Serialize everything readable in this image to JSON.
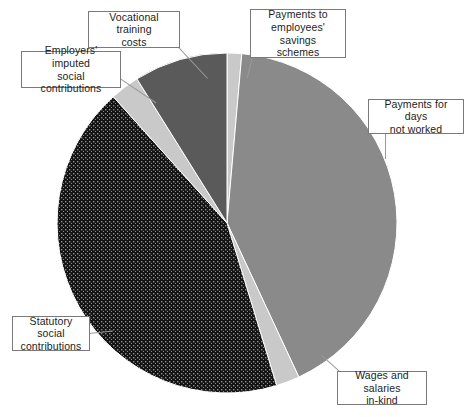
{
  "chart_data": {
    "type": "pie",
    "title": "",
    "subtitle": "",
    "xlabel": "",
    "ylabel": "",
    "legend_position": "callout-labels",
    "grid": false,
    "categories": [
      "Payments to employees' savings schemes",
      "Payments for days not worked",
      "Wages and salaries in-kind",
      "Statutory social contributions",
      "Employers' imputed social contributions",
      "Vocational training costs"
    ],
    "values": [
      1.4,
      41.7,
      2.2,
      43.1,
      2.8,
      8.8
    ],
    "slices": [
      {
        "label": "Payments to employees' savings schemes",
        "value": 1.4,
        "start_angle_deg": 0,
        "end_angle_deg": 5,
        "color": "#c9c9c9",
        "fill": "solid"
      },
      {
        "label": "Payments for days not worked",
        "value": 41.7,
        "start_angle_deg": 5,
        "end_angle_deg": 155,
        "color": "#8a8a8a",
        "fill": "solid"
      },
      {
        "label": "Wages and salaries in-kind",
        "value": 2.2,
        "start_angle_deg": 155,
        "end_angle_deg": 163,
        "color": "#c9c9c9",
        "fill": "solid"
      },
      {
        "label": "Statutory social contributions",
        "value": 43.1,
        "start_angle_deg": 163,
        "end_angle_deg": 318,
        "color": "#171717",
        "fill": "dotted"
      },
      {
        "label": "Employers' imputed social contributions",
        "value": 2.8,
        "start_angle_deg": 318,
        "end_angle_deg": 328,
        "color": "#c9c9c9",
        "fill": "solid"
      },
      {
        "label": "Vocational training costs",
        "value": 8.8,
        "start_angle_deg": 328,
        "end_angle_deg": 360,
        "color": "#5a5a5a",
        "fill": "solid"
      }
    ],
    "geometry": {
      "center_x": 227,
      "center_y": 223,
      "radius": 170
    }
  },
  "labels": {
    "vocational_training": "Vocational training\ncosts",
    "employers_imputed": "Employers' imputed\nsocial contributions",
    "savings_schemes": "Payments to\nemployees' savings\nschemes",
    "days_not_worked": "Payments for days\nnot worked",
    "statutory_social": "Statutory social\ncontributions",
    "wages_in_kind": "Wages and salaries\nin-kind"
  }
}
